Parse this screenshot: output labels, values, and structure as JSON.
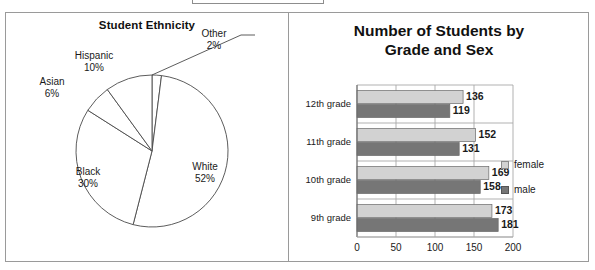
{
  "top_caption": "",
  "pie_panel": {
    "title": "Student Ethnicity",
    "chart_data": {
      "type": "pie",
      "title": "Student Ethnicity",
      "categories": [
        "White",
        "Black",
        "Asian",
        "Hispanic",
        "Other"
      ],
      "values": [
        52,
        30,
        6,
        10,
        2
      ],
      "unit": "%",
      "labels": [
        "White 52%",
        "Black 30%",
        "Asian 6%",
        "Hispanic 10%",
        "Other 2%"
      ],
      "legend": "none",
      "slice_fill": "#ffffff",
      "slice_stroke": "#4a4a4a"
    },
    "slices": [
      {
        "name": "White",
        "pct_text": "52%",
        "value": 52
      },
      {
        "name": "Black",
        "pct_text": "30%",
        "value": 30
      },
      {
        "name": "Asian",
        "pct_text": "6%",
        "value": 6
      },
      {
        "name": "Hispanic",
        "pct_text": "10%",
        "value": 10
      },
      {
        "name": "Other",
        "pct_text": "2%",
        "value": 2
      }
    ]
  },
  "bar_panel": {
    "title_line1": "Number of Students by",
    "title_line2": "Grade and Sex",
    "chart_data": {
      "type": "bar",
      "orientation": "horizontal",
      "title": "Number of Students by Grade and Sex",
      "categories": [
        "9th grade",
        "10th grade",
        "11th grade",
        "12th grade"
      ],
      "series": [
        {
          "name": "female",
          "values": [
            173,
            169,
            152,
            136
          ],
          "color": "#d2d2d2"
        },
        {
          "name": "male",
          "values": [
            181,
            158,
            131,
            119
          ],
          "color": "#767676"
        }
      ],
      "xlabel": "",
      "ylabel": "",
      "xlim": [
        0,
        200
      ],
      "xticks": [
        0,
        50,
        100,
        150,
        200
      ],
      "grid": true,
      "legend_position": "right"
    },
    "rows": [
      {
        "category": "12th grade",
        "female": "136",
        "male": "119",
        "female_v": 136,
        "male_v": 119
      },
      {
        "category": "11th grade",
        "female": "152",
        "male": "131",
        "female_v": 152,
        "male_v": 131
      },
      {
        "category": "10th grade",
        "female": "169",
        "male": "158",
        "female_v": 169,
        "male_v": 158
      },
      {
        "category": "9th grade",
        "female": "173",
        "male": "181",
        "female_v": 173,
        "male_v": 181
      }
    ],
    "xticks": [
      "0",
      "50",
      "100",
      "150",
      "200"
    ],
    "legend": [
      {
        "label": "female",
        "color": "#d2d2d2"
      },
      {
        "label": "male",
        "color": "#767676"
      }
    ]
  }
}
